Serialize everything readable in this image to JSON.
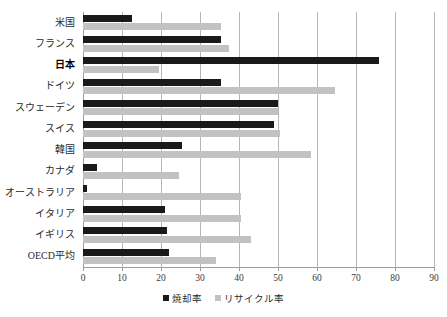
{
  "chart_data": {
    "type": "bar",
    "orientation": "horizontal",
    "title": "",
    "xlabel": "",
    "ylabel": "",
    "xlim": [
      0,
      90
    ],
    "xticks": [
      0,
      10,
      20,
      30,
      40,
      50,
      60,
      70,
      80,
      90
    ],
    "xtick_labels": [
      "0",
      "10",
      "20",
      "30",
      "40",
      "50",
      "60",
      "70",
      "80",
      "90"
    ],
    "grid": true,
    "legend_position": "bottom-center",
    "categories": [
      "米国",
      "フランス",
      "日本",
      "ドイツ",
      "スウェーデン",
      "スイス",
      "韓国",
      "カナダ",
      "オーストラリア",
      "イタリア",
      "イギリス",
      "OECD平均"
    ],
    "emphasized_category": "日本",
    "series": [
      {
        "name": "焼却率",
        "color": "#1a1a1a",
        "values": [
          12.5,
          35.5,
          76,
          35.5,
          50,
          49,
          25.5,
          3.5,
          1,
          21,
          21.5,
          22
        ]
      },
      {
        "name": "リサイクル率",
        "color": "#c2c2c2",
        "values": [
          35.5,
          37.5,
          19.5,
          64.5,
          50,
          50.5,
          58.5,
          24.5,
          40.5,
          40.5,
          43,
          34
        ]
      }
    ]
  },
  "legend": {
    "entries": [
      {
        "label": "焼却率",
        "swatch": "incin"
      },
      {
        "label": "リサイクル率",
        "swatch": "recyc"
      }
    ]
  }
}
